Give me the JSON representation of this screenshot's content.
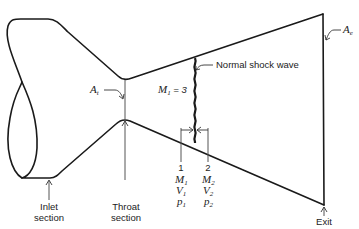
{
  "diagram": {
    "labels": {
      "throat_area": {
        "symbol": "A",
        "subscript": "t"
      },
      "exit_area": {
        "symbol": "A",
        "subscript": "e"
      },
      "upstream_mach": {
        "symbol": "M",
        "subscript": "1",
        "value_text": " = 3"
      },
      "shock_label": "Normal shock wave",
      "station_1": {
        "number": "1",
        "rows": [
          {
            "symbol": "M",
            "subscript": "1"
          },
          {
            "symbol": "V",
            "subscript": "1"
          },
          {
            "symbol": "p",
            "subscript": "1"
          }
        ]
      },
      "station_2": {
        "number": "2",
        "rows": [
          {
            "symbol": "M",
            "subscript": "2"
          },
          {
            "symbol": "V",
            "subscript": "2"
          },
          {
            "symbol": "p",
            "subscript": "2"
          }
        ]
      },
      "inlet": {
        "line1": "Inlet",
        "line2": "section"
      },
      "throat": {
        "line1": "Throat",
        "line2": "section"
      },
      "exit": {
        "line1": "Exit",
        "line2": "section, ",
        "line2_italic": "e"
      }
    },
    "colors": {
      "stroke": "#1a1a1a",
      "background": "#ffffff"
    }
  }
}
